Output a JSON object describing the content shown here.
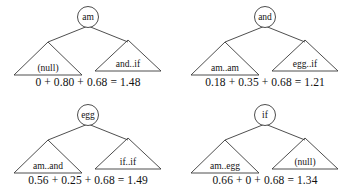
{
  "figure": {
    "background_color": "#ffffff",
    "stroke_color": "#3a3a3a",
    "text_color": "#141414"
  },
  "trees": [
    {
      "id": "tree-am",
      "root_label": "am",
      "left_label": "(null)",
      "right_label": "and..if",
      "formula": "0 + 0.80 + 0.68 = 1.48",
      "formula_terms": [
        "0",
        "0.80",
        "0.68"
      ],
      "formula_total": "1.48"
    },
    {
      "id": "tree-and",
      "root_label": "and",
      "left_label": "am..am",
      "right_label": "egg..if",
      "formula": "0.18 + 0.35 + 0.68 = 1.21",
      "formula_terms": [
        "0.18",
        "0.35",
        "0.68"
      ],
      "formula_total": "1.21"
    },
    {
      "id": "tree-egg",
      "root_label": "egg",
      "left_label": "am..and",
      "right_label": "if..if",
      "formula": "0.56 + 0.25 + 0.68 = 1.49",
      "formula_terms": [
        "0.56",
        "0.25",
        "0.68"
      ],
      "formula_total": "1.49"
    },
    {
      "id": "tree-if",
      "root_label": "if",
      "left_label": "am..egg",
      "right_label": "(null)",
      "formula": "0.66 + 0 + 0.68 = 1.34",
      "formula_terms": [
        "0.66",
        "0",
        "0.68"
      ],
      "formula_total": "1.34"
    }
  ]
}
